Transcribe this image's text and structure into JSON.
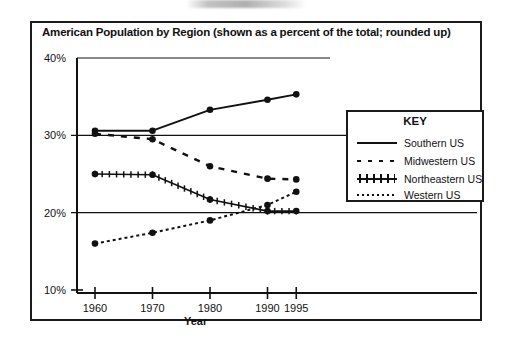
{
  "chart_data": {
    "type": "line",
    "title": "American Population by Region (shown as a percent of the total; rounded up)",
    "xlabel": "Year",
    "ylabel": "",
    "x": [
      1960,
      1970,
      1980,
      1990,
      1995
    ],
    "xtick_labels": [
      "1960",
      "1970",
      "1980",
      "1990",
      "1995"
    ],
    "ytick_labels": [
      "40%",
      "30%",
      "20%",
      "10%"
    ],
    "ytick_values": [
      40,
      30,
      20,
      10
    ],
    "ylim": [
      10,
      40
    ],
    "grid": "horizontal-only",
    "legend_position": "right-inside",
    "series": [
      {
        "name": "Southern US",
        "style": "solid",
        "values": [
          30.6,
          30.6,
          33.3,
          34.6,
          35.3
        ]
      },
      {
        "name": "Midwestern US",
        "style": "dashed",
        "values": [
          30.2,
          29.5,
          26.0,
          24.4,
          24.3
        ]
      },
      {
        "name": "Northeastern US",
        "style": "cross-hatched",
        "values": [
          25.0,
          24.9,
          21.7,
          20.2,
          20.2
        ]
      },
      {
        "name": "Western US",
        "style": "dotted",
        "values": [
          16.0,
          17.4,
          19.0,
          21.0,
          22.7
        ]
      }
    ]
  },
  "legend": {
    "title": "KEY",
    "entries": [
      {
        "label": "Southern US"
      },
      {
        "label": "Midwestern US"
      },
      {
        "label": "Northeastern US"
      },
      {
        "label": "Western US"
      }
    ]
  },
  "axes": {
    "y_ticks": [
      {
        "label": "40%"
      },
      {
        "label": "30%"
      },
      {
        "label": "20%"
      },
      {
        "label": "10%"
      }
    ],
    "x_ticks": [
      {
        "label": "1960"
      },
      {
        "label": "1970"
      },
      {
        "label": "1980"
      },
      {
        "label": "1990"
      },
      {
        "label": "1995"
      }
    ],
    "x_axis_title": "Year"
  },
  "colors": {
    "ink": "#111111",
    "frame": "#1a1a1a",
    "background": "#ffffff"
  }
}
